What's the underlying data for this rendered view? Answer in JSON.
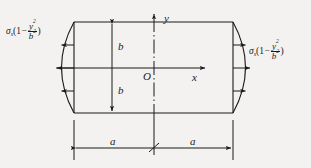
{
  "figure": {
    "type": "engineering-stress-diagram",
    "background_color": "#f3f2f0",
    "line_color": "#1a1a1a",
    "axes": {
      "x_label": "x",
      "y_label": "y",
      "origin_label": "O"
    },
    "dimensions": {
      "vertical_upper": "b",
      "vertical_lower": "b",
      "horizontal_left": "a",
      "horizontal_right": "a"
    },
    "load": {
      "left_label": {
        "symbol": "σ",
        "subscript": "s",
        "open_paren": "(",
        "one": "1",
        "minus": "−",
        "numerator": "y",
        "numerator_exponent": "2",
        "denominator": "b",
        "denominator_exponent": "2",
        "close_paren": ")",
        "plain": "σs(1−y²/b²)"
      },
      "right_label": {
        "symbol": "σ",
        "subscript": "s",
        "open_paren": "(",
        "one": "1",
        "minus": "−",
        "numerator": "y",
        "numerator_exponent": "2",
        "denominator": "b",
        "denominator_exponent": "2",
        "close_paren": ")",
        "plain": "σs(1−y²/b²)"
      },
      "left_arrow_count": 3,
      "right_arrow_count": 3,
      "left_arrow_direction": "left",
      "right_arrow_direction": "right"
    },
    "geometry": {
      "rect_left": 74,
      "rect_right": 233,
      "rect_top": 22,
      "rect_bottom": 113,
      "center_x": 154,
      "center_y": 68,
      "bulge": 22,
      "dim_line_y": 148
    }
  }
}
